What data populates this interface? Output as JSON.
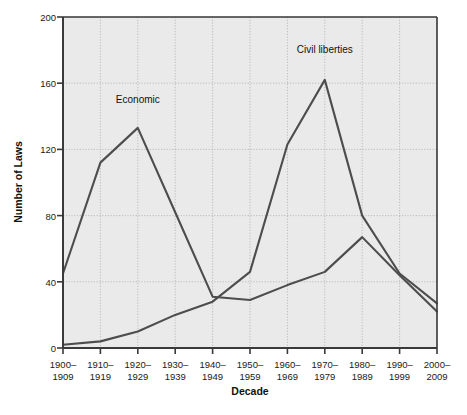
{
  "chart_data": {
    "type": "line",
    "title": "",
    "xlabel": "Decade",
    "ylabel": "Number of Laws",
    "ylim": [
      0,
      200
    ],
    "yticks": [
      0,
      40,
      80,
      120,
      160,
      200
    ],
    "grid": true,
    "legend_position": "inline-annotations",
    "categories": [
      "1900–\n1909",
      "1910–\n1919",
      "1920–\n1929",
      "1930–\n1939",
      "1940–\n1949",
      "1950–\n1959",
      "1960–\n1969",
      "1970–\n1979",
      "1980–\n1989",
      "1990–\n1999",
      "2000–\n2009"
    ],
    "category_lines": [
      [
        "1900–",
        "1909"
      ],
      [
        "1910–",
        "1919"
      ],
      [
        "1920–",
        "1929"
      ],
      [
        "1930–",
        "1939"
      ],
      [
        "1940–",
        "1949"
      ],
      [
        "1950–",
        "1959"
      ],
      [
        "1960–",
        "1969"
      ],
      [
        "1970–",
        "1979"
      ],
      [
        "1980–",
        "1989"
      ],
      [
        "1990–",
        "1999"
      ],
      [
        "2000–",
        "2009"
      ]
    ],
    "series": [
      {
        "name": "Economic",
        "color": "#4d4d4d",
        "values": [
          45,
          112,
          133,
          82,
          31,
          29,
          38,
          46,
          67,
          44,
          22
        ]
      },
      {
        "name": "Civil liberties",
        "color": "#4d4d4d",
        "values": [
          2,
          4,
          10,
          20,
          28,
          46,
          123,
          162,
          80,
          45,
          27
        ]
      }
    ],
    "annotations": [
      {
        "text": "Economic",
        "x_category": "1920–1929",
        "y": 148
      },
      {
        "text": "Civil liberties",
        "x_category": "1970–1979",
        "y": 178
      }
    ]
  },
  "axes": {
    "y_title": "Number of Laws",
    "x_title": "Decade",
    "ytick_0": "0",
    "ytick_40": "40",
    "ytick_80": "80",
    "ytick_120": "120",
    "ytick_160": "160",
    "ytick_200": "200"
  },
  "series_labels": {
    "economic": "Economic",
    "civil_liberties": "Civil liberties"
  },
  "xtick_labels": {
    "t0_top": "1900–",
    "t0_bot": "1909",
    "t1_top": "1910–",
    "t1_bot": "1919",
    "t2_top": "1920–",
    "t2_bot": "1929",
    "t3_top": "1930–",
    "t3_bot": "1939",
    "t4_top": "1940–",
    "t4_bot": "1949",
    "t5_top": "1950–",
    "t5_bot": "1959",
    "t6_top": "1960–",
    "t6_bot": "1969",
    "t7_top": "1970–",
    "t7_bot": "1979",
    "t8_top": "1980–",
    "t8_bot": "1989",
    "t9_top": "1990–",
    "t9_bot": "1999",
    "t10_top": "2000–",
    "t10_bot": "2009"
  },
  "caption": {
    "text": ""
  },
  "colors": {
    "plot_bg": "#eaeaea",
    "line": "#4d4d4d",
    "axis": "#3a3a3a",
    "grid": "#b0b0b0"
  }
}
